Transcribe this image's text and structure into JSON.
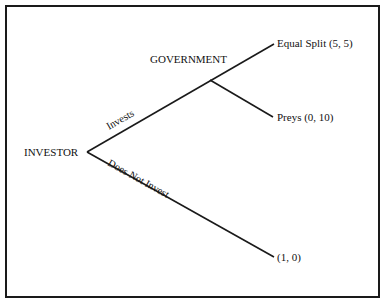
{
  "diagram": {
    "type": "game-tree",
    "nodes": {
      "root": {
        "label": "INVESTOR"
      },
      "decision": {
        "label": "GOVERNMENT"
      }
    },
    "edges": {
      "invests": {
        "label": "Invests"
      },
      "does_not_invest": {
        "label": "Does Not Invest"
      }
    },
    "outcomes": {
      "equal_split": {
        "label": "Equal Split (5, 5)"
      },
      "preys": {
        "label": "Preys (0, 10)"
      },
      "no_invest": {
        "label": "(1, 0)"
      }
    },
    "colors": {
      "line": "#1a1a1a",
      "text": "#111111",
      "background": "#ffffff"
    }
  }
}
